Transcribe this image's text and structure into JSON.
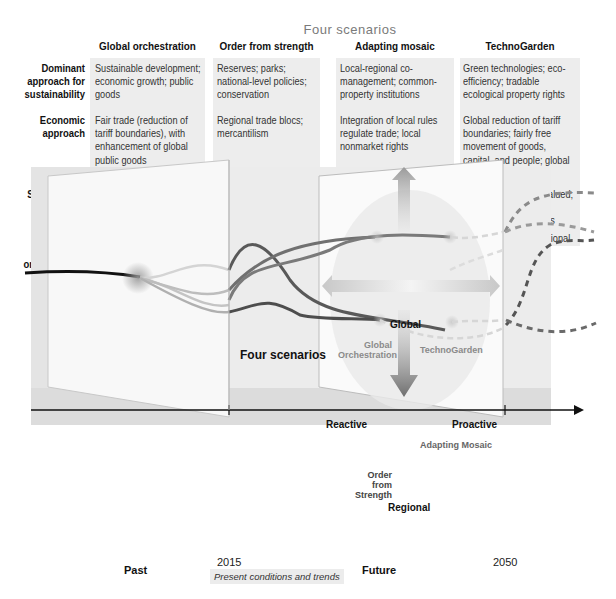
{
  "table": {
    "title": "Four scenarios",
    "columns": [
      "Global orchestration",
      "Order from strength",
      "Adapting mosaic",
      "TechnoGarden"
    ],
    "rows": [
      {
        "label": "Dominant approach for sustainability",
        "label_lines": [
          "Dominant",
          "approach for",
          "sustainability"
        ],
        "cells": [
          "Sustainable development; economic growth; public goods",
          "Reserves; parks; national-level policies; conservation",
          "Local-regional co-management; common-property institutions",
          "Green technologies; eco-efficiency; tradable ecological property rights"
        ]
      },
      {
        "label": "Economic approach",
        "label_lines": [
          "Economic",
          "approach"
        ],
        "cells": [
          "Fair trade (reduction of tariff boundaries), with enhancement of global public goods",
          "Regional trade blocs; mercantilism",
          "Integration of local rules regulate trade; local nonmarket rights",
          "Global reduction of tariff boundaries; fairly free movement of goods, capital, and people; global markets in ecological property"
        ]
      },
      {
        "label": "Social policy foci",
        "label_lines": [
          "Social policy",
          "foci"
        ],
        "cells": [
          "Improve world; global public health; global education",
          "Security and protection",
          "Local communities linked to global communities; local equity important",
          "Technical expertise valued; follow opportunity; competition; openness"
        ]
      },
      {
        "label": "Dominant social organizations",
        "label_lines": [
          "Dominant",
          "social",
          "organizations"
        ],
        "cells": [
          "Transregional companies; global NGO and multilateral organizations",
          "Multinational companies",
          "Cooperatives; global organizations",
          "Transnational professional associations; NGOs"
        ]
      }
    ]
  },
  "diagram": {
    "center_label": "Four scenarios",
    "axes": {
      "up": "Global",
      "down": "Regional",
      "left": "Reactive",
      "right": "Proactive"
    },
    "quadrants": {
      "top_left": "Global Orchestration",
      "top_right": "TechnoGarden",
      "bottom_left": "Order from Strength",
      "bottom_right": "Adapting Mosaic"
    },
    "timeline": {
      "ticks": [
        "2015",
        "2050"
      ],
      "past_label": "Past",
      "future_label": "Future",
      "present_caption": "Present conditions and trends"
    },
    "colors": {
      "trend_line": "#111111",
      "scenario_dark": "#555555",
      "scenario_mid": "#777777",
      "scenario_light": "#bbbbbb",
      "panel_bg": "#ececec"
    }
  }
}
